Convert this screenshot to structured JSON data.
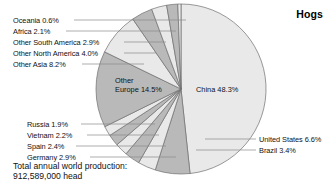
{
  "title": "Hogs",
  "footnote": {
    "line1": "Total annual world production:",
    "line2": "912,589,000 head"
  },
  "geometry": {
    "cx": 181,
    "cy": 89,
    "r": 85,
    "start_angle_deg": -90
  },
  "colors": {
    "light": "#e9e9e9",
    "mid": "#b9b9b9",
    "dark": "#9d9d9d",
    "stroke": "#6e6e6e",
    "leader": "#8a8a8a",
    "text": "#111111"
  },
  "labels_left": [
    {
      "text": "Oceania 0.6%",
      "x": 13,
      "y": 16,
      "line_x1": 74,
      "line_x2": 186,
      "line_y": 20
    },
    {
      "text": "Africa 2.1%",
      "x": 13,
      "y": 27,
      "line_x1": 66,
      "line_x2": 176,
      "line_y": 31
    },
    {
      "text": "Other South America 2.9%",
      "x": 13,
      "y": 38,
      "line_x1": 124,
      "line_x2": 166,
      "line_y": 42
    },
    {
      "text": "Other North America 4.0%",
      "x": 13,
      "y": 49,
      "line_x1": 124,
      "line_x2": 156,
      "line_y": 53
    },
    {
      "text": "Other Asia 8.2%",
      "x": 13,
      "y": 60,
      "line_x1": 82,
      "line_x2": 144,
      "line_y": 64
    }
  ],
  "labels_lower_left": [
    {
      "text": "Russia 1.9%",
      "x": 27,
      "y": 120,
      "line_x1": 81,
      "line_x2": 155,
      "line_y": 124
    },
    {
      "text": "Vietnam 2.2%",
      "x": 27,
      "y": 131,
      "line_x1": 87,
      "line_x2": 159,
      "line_y": 135
    },
    {
      "text": "Spain 2.4%",
      "x": 27,
      "y": 142,
      "line_x1": 76,
      "line_x2": 166,
      "line_y": 146
    },
    {
      "text": "Germany 2.9%",
      "x": 27,
      "y": 153,
      "line_x1": 90,
      "line_x2": 176,
      "line_y": 157
    }
  ],
  "labels_right": [
    {
      "text": "United States 6.6%",
      "x": 259,
      "y": 135,
      "line_x1": 205,
      "line_x2": 256,
      "line_y": 139
    },
    {
      "text": "Brazil 3.4%",
      "x": 259,
      "y": 146,
      "line_x1": 196,
      "line_x2": 256,
      "line_y": 150
    }
  ],
  "labels_inside": [
    {
      "text": "China 48.3%",
      "x": 196,
      "y": 85
    },
    {
      "text": "Other",
      "x": 115,
      "y": 76
    },
    {
      "text": "Europe 14.5%",
      "x": 115,
      "y": 85
    }
  ],
  "chart_data": {
    "type": "pie",
    "title": "Hogs",
    "unit": "percent of world hog production",
    "total_label": "Total annual world production: 912,589,000 head",
    "total_value": 912589000,
    "categories": [
      "China",
      "United States",
      "Brazil",
      "Germany",
      "Spain",
      "Vietnam",
      "Russia",
      "Other Europe",
      "Other Asia",
      "Other North America",
      "Other South America",
      "Africa",
      "Oceania"
    ],
    "values": [
      48.3,
      6.6,
      3.4,
      2.9,
      2.4,
      2.2,
      1.9,
      14.5,
      8.2,
      4.0,
      2.9,
      2.1,
      0.6
    ],
    "slice_shades": [
      "light",
      "mid",
      "light",
      "mid",
      "light",
      "mid",
      "light",
      "mid",
      "light",
      "mid",
      "light",
      "mid",
      "light"
    ],
    "legend": "none",
    "labels_on_slices": true,
    "start_angle_deg": -90,
    "direction": "clockwise"
  }
}
